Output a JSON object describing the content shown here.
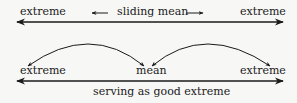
{
  "top_row": {
    "left_label": "extreme",
    "center_label": "sliding mean",
    "right_label": "extreme"
  },
  "bottom_row": {
    "left_label": "extreme",
    "center_label": "mean",
    "right_label": "extreme",
    "caption": "serving as good extreme"
  },
  "colors": {
    "background": "#f7f7f6",
    "ink": "#1a1a1a"
  }
}
